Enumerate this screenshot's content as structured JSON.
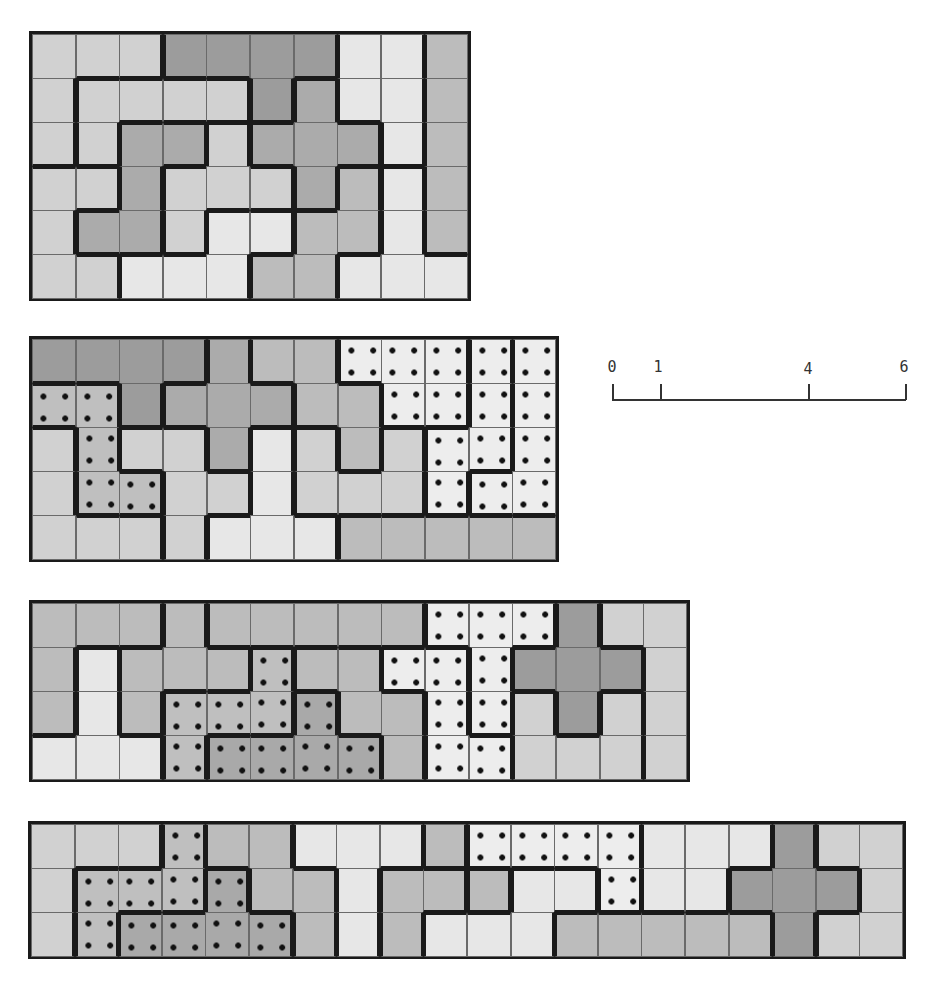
{
  "shades": {
    "VL": "#e7e7e7",
    "L": "#d1d1d1",
    "M": "#bcbcbc",
    "MD": "#ababab",
    "D": "#9c9c9c",
    "dVL": "#ededed",
    "dM": "#bfbfbf",
    "dD": "#a9a9a9"
  },
  "dotted_shades": [
    "dVL",
    "dM",
    "dD"
  ],
  "scale_bar": {
    "ticks": [
      {
        "label": "0",
        "value": 0
      },
      {
        "label": "1",
        "value": 1
      },
      {
        "label": "4",
        "value": 4
      },
      {
        "label": "6",
        "value": 6
      }
    ]
  },
  "grids": [
    {
      "name": "rectangle-10x6",
      "cols": 10,
      "rows": 6,
      "pieces": [
        "A A A B B B B C C D",
        "A E E E E B G C C D",
        "A E H H I G G G C D",
        "J J H I I I G K L D",
        "J H H I N N K K L D",
        "J J N N N K K L L L"
      ],
      "piece_shades": {
        "A": "L",
        "B": "D",
        "C": "VL",
        "D": "M",
        "E": "L",
        "G": "MD",
        "H": "MD",
        "I": "L",
        "J": "L",
        "K": "M",
        "L": "VL",
        "N": "VL"
      }
    },
    {
      "name": "rectangle-12x5",
      "cols": 12,
      "rows": 5,
      "pieces": [
        "P P P P Q R R S S S T U",
        "V V P Q Q Q R R S S T U",
        "W V X X Q Y Z R Z T T U",
        "W V V X X Y Z Z Z T U U",
        "W W W X Y Y Y a a a a a"
      ],
      "piece_shades": {
        "P": "D",
        "Q": "MD",
        "R": "M",
        "S": "dVL",
        "T": "dVL",
        "U": "dVL",
        "V": "dM",
        "W": "L",
        "X": "L",
        "Y": "VL",
        "Z": "L",
        "a": "M"
      }
    },
    {
      "name": "rectangle-15x4",
      "cols": 15,
      "rows": 4,
      "pieces": [
        "A A A B C C C C C D D D E F F",
        "A G B B B H I I J J D E E E F",
        "A G B H H H K I I J D L E L F",
        "G G G H K K K K I J J L L L F"
      ],
      "piece_shades": {
        "A": "M",
        "B": "M",
        "C": "M",
        "D": "dVL",
        "E": "D",
        "F": "L",
        "G": "VL",
        "H": "dM",
        "I": "M",
        "J": "dVL",
        "K": "dD",
        "L": "L"
      }
    },
    {
      "name": "rectangle-20x3",
      "cols": 20,
      "rows": 3,
      "pieces": [
        "A A A B C C D D D E F F F F G G G H I I",
        "A B B B J C C D K K E L L F G G H H H I",
        "A B J J J J C D K L L L M M M M M H I I"
      ],
      "piece_shades": {
        "A": "L",
        "B": "dM",
        "C": "M",
        "D": "VL",
        "E": "M",
        "F": "dVL",
        "G": "VL",
        "H": "D",
        "I": "L",
        "J": "dD",
        "K": "M",
        "L": "VL",
        "M": "M"
      }
    }
  ]
}
